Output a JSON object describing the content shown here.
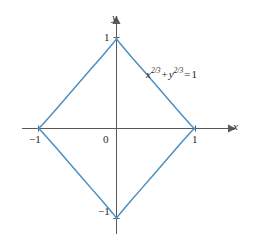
{
  "figure": {
    "background_color": "#ffffff",
    "axis_color": "#58595b",
    "curve_color": "#4a90c4",
    "text_color": "#231f20"
  },
  "axes": {
    "x_axis_label": "x",
    "y_axis_label": "y",
    "origin_label": "0",
    "x_ticks": [
      {
        "label": "−1",
        "value": -1
      },
      {
        "label": "1",
        "value": 1
      }
    ],
    "y_ticks": [
      {
        "label": "1",
        "value": 1
      },
      {
        "label": "−1",
        "value": -1
      }
    ]
  },
  "annotation": {
    "equation": {
      "full_text": "x^(2/3) + y^(2/3) = 1",
      "x_var": "x",
      "x_exponent": "2/3",
      "plus": "+",
      "y_var": "y",
      "y_exponent": "2/3",
      "equals": "=",
      "rhs": "1"
    }
  },
  "chart_data": {
    "type": "line",
    "title": "",
    "subtitle": "",
    "xlabel": "x",
    "ylabel": "y",
    "xlim": [
      -1.35,
      1.35
    ],
    "ylim": [
      -1.35,
      1.35
    ],
    "grid": false,
    "legend_position": "none",
    "annotations": [
      {
        "text": "x^(2/3) + y^(2/3) = 1",
        "x": 0.55,
        "y": 0.72
      }
    ],
    "series": [
      {
        "name": "astroid: x^(2/3) + y^(2/3) = 1",
        "color": "#4a90c4",
        "parametric": true,
        "parameterization": "x = cos(t)^3, y = sin(t)^3, t in [0, 2*pi)",
        "closed": true,
        "cusps": [
          {
            "x": 1,
            "y": 0
          },
          {
            "x": 0,
            "y": 1
          },
          {
            "x": -1,
            "y": 0
          },
          {
            "x": 0,
            "y": -1
          }
        ],
        "x": [
          1.0,
          0.985,
          0.941,
          0.87,
          0.777,
          0.67,
          0.552,
          0.431,
          0.313,
          0.205,
          0.113,
          0.044,
          0.005,
          0.0,
          -0.005,
          -0.044,
          -0.113,
          -0.205,
          -0.313,
          -0.431,
          -0.552,
          -0.67,
          -0.777,
          -0.87,
          -0.941,
          -0.985,
          -1.0,
          -0.985,
          -0.941,
          -0.87,
          -0.777,
          -0.67,
          -0.552,
          -0.431,
          -0.313,
          -0.205,
          -0.113,
          -0.044,
          -0.005,
          0.0,
          0.005,
          0.044,
          0.113,
          0.205,
          0.313,
          0.431,
          0.552,
          0.67,
          0.777,
          0.87,
          0.941,
          0.985,
          1.0
        ],
        "y": [
          0.0,
          0.005,
          0.044,
          0.113,
          0.205,
          0.313,
          0.431,
          0.552,
          0.67,
          0.777,
          0.87,
          0.941,
          0.985,
          1.0,
          0.985,
          0.941,
          0.87,
          0.777,
          0.67,
          0.552,
          0.431,
          0.313,
          0.205,
          0.113,
          0.044,
          0.005,
          0.0,
          -0.005,
          -0.044,
          -0.113,
          -0.205,
          -0.313,
          -0.431,
          -0.552,
          -0.67,
          -0.777,
          -0.87,
          -0.941,
          -0.985,
          -1.0,
          -0.985,
          -0.941,
          -0.87,
          -0.777,
          -0.67,
          -0.552,
          -0.431,
          -0.313,
          -0.205,
          -0.113,
          -0.044,
          -0.005,
          0.0
        ]
      }
    ]
  }
}
